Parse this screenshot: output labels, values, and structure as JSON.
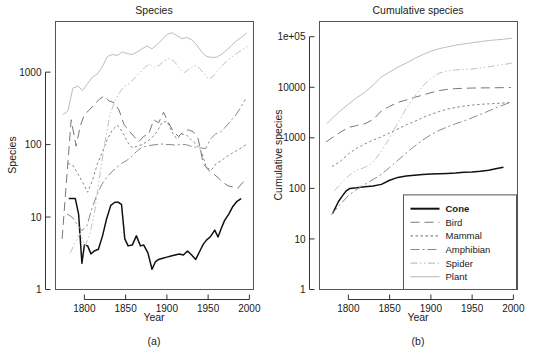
{
  "figure": {
    "width": 535,
    "height": 353,
    "background": "#ffffff"
  },
  "panels": [
    {
      "id": "panel-a",
      "caption": "(a)",
      "title": "Species",
      "xlabel": "Year",
      "ylabel": "Species"
    },
    {
      "id": "panel-b",
      "caption": "(b)",
      "title": "Cumulative species",
      "xlabel": "Year",
      "ylabel": "Cumulative species"
    }
  ],
  "legend": {
    "position": "bottom-right-panel-b",
    "entries": [
      {
        "label": "Cone",
        "color": "#111111",
        "dash": "none",
        "width": 2.0
      },
      {
        "label": "Bird",
        "color": "#777777",
        "dash": "long-dash",
        "width": 1.1
      },
      {
        "label": "Mammal",
        "color": "#888888",
        "dash": "dotted",
        "width": 1.1
      },
      {
        "label": "Amphibian",
        "color": "#8a8a8a",
        "dash": "dash-dot",
        "width": 1.1
      },
      {
        "label": "Spider",
        "color": "#c2c2c2",
        "dash": "dash-dot-dot",
        "width": 1.1
      },
      {
        "label": "Plant",
        "color": "#bdbdbd",
        "dash": "none",
        "width": 1.1
      }
    ]
  },
  "chart_data": [
    {
      "type": "line",
      "panel": "a",
      "title": "Species",
      "xlabel": "Year",
      "ylabel": "Species",
      "xlim": [
        1765,
        2005
      ],
      "ylim": [
        1,
        5000
      ],
      "yscale": "log",
      "xticks": [
        1800,
        1850,
        1900,
        1950,
        2000
      ],
      "xtick_labels": [
        "1800",
        "1850",
        "1900",
        "1950",
        "2000"
      ],
      "yticks": [
        1,
        10,
        100,
        1000
      ],
      "ytick_labels": [
        "1",
        "10",
        "100",
        "1000"
      ],
      "grid": false,
      "legend_position": "none",
      "series": [
        {
          "name": "Cone",
          "color": "#111111",
          "dash": "none",
          "x": [
            1781,
            1789,
            1793,
            1797,
            1800,
            1804,
            1808,
            1812,
            1817,
            1822,
            1827,
            1832,
            1837,
            1841,
            1845,
            1849,
            1853,
            1858,
            1863,
            1868,
            1872,
            1877,
            1882,
            1886,
            1890,
            1895,
            1900,
            1905,
            1910,
            1915,
            1920,
            1925,
            1930,
            1935,
            1940,
            1944,
            1948,
            1953,
            1958,
            1962,
            1966,
            1970,
            1975,
            1980,
            1985,
            1990
          ],
          "y": [
            18,
            18,
            11,
            2.3,
            4.1,
            4.0,
            3.1,
            3.4,
            3.6,
            5.5,
            9.5,
            14.5,
            16,
            16,
            15,
            5.0,
            4.0,
            4.1,
            5.5,
            4.0,
            4.1,
            3.2,
            1.9,
            2.4,
            2.6,
            2.7,
            2.8,
            2.9,
            3.0,
            3.1,
            3.0,
            3.4,
            3.0,
            2.6,
            3.4,
            4.2,
            4.8,
            5.4,
            6.6,
            5.3,
            7.0,
            9.0,
            11.0,
            14.0,
            16.5,
            18.0
          ]
        },
        {
          "name": "Bird",
          "color": "#777777",
          "dash": "long-dash",
          "x": [
            1773,
            1779,
            1784,
            1790,
            1795,
            1800,
            1806,
            1812,
            1818,
            1824,
            1830,
            1836,
            1842,
            1848,
            1854,
            1860,
            1866,
            1872,
            1878,
            1884,
            1890,
            1896,
            1902,
            1908,
            1914,
            1920,
            1926,
            1932,
            1938,
            1944,
            1950,
            1956,
            1962,
            1968,
            1974,
            1980,
            1986,
            1992,
            1997
          ],
          "y": [
            5,
            40,
            220,
            95,
            180,
            260,
            300,
            360,
            420,
            470,
            400,
            380,
            300,
            190,
            155,
            130,
            110,
            130,
            140,
            220,
            200,
            280,
            200,
            150,
            130,
            150,
            160,
            150,
            120,
            55,
            45,
            40,
            35,
            30,
            27,
            26,
            25,
            30,
            35
          ]
        },
        {
          "name": "Mammal",
          "color": "#888888",
          "dash": "dotted",
          "x": [
            1780,
            1786,
            1792,
            1798,
            1804,
            1810,
            1816,
            1822,
            1828,
            1834,
            1840,
            1846,
            1852,
            1858,
            1864,
            1870,
            1876,
            1882,
            1888,
            1894,
            1900,
            1906,
            1912,
            1918,
            1924,
            1930,
            1936,
            1942,
            1948,
            1954,
            1960,
            1966,
            1972,
            1978,
            1984,
            1990,
            1996
          ],
          "y": [
            55,
            52,
            40,
            30,
            22,
            33,
            55,
            80,
            120,
            160,
            185,
            150,
            110,
            90,
            95,
            100,
            110,
            125,
            150,
            200,
            210,
            150,
            120,
            140,
            135,
            115,
            100,
            80,
            48,
            45,
            55,
            60,
            68,
            75,
            82,
            90,
            100
          ]
        },
        {
          "name": "Amphibian",
          "color": "#8a8a8a",
          "dash": "dash-dot",
          "x": [
            1779,
            1785,
            1791,
            1797,
            1803,
            1809,
            1815,
            1821,
            1827,
            1833,
            1839,
            1845,
            1851,
            1857,
            1863,
            1869,
            1875,
            1881,
            1887,
            1893,
            1899,
            1905,
            1911,
            1917,
            1923,
            1929,
            1935,
            1941,
            1947,
            1953,
            1959,
            1965,
            1971,
            1977,
            1983,
            1989,
            1995
          ],
          "y": [
            11,
            10,
            8,
            6.5,
            7.5,
            13,
            20,
            28,
            35,
            42,
            48,
            55,
            60,
            68,
            80,
            90,
            95,
            98,
            100,
            102,
            100,
            100,
            98,
            100,
            100,
            95,
            92,
            90,
            88,
            120,
            140,
            150,
            175,
            210,
            250,
            320,
            420
          ]
        },
        {
          "name": "Spider",
          "color": "#c2c2c2",
          "dash": "dash-dot-dot",
          "x": [
            1783,
            1789,
            1795,
            1801,
            1807,
            1813,
            1819,
            1825,
            1831,
            1837,
            1843,
            1849,
            1855,
            1861,
            1867,
            1873,
            1879,
            1885,
            1891,
            1897,
            1903,
            1909,
            1915,
            1921,
            1927,
            1933,
            1939,
            1945,
            1951,
            1957,
            1963,
            1969,
            1975,
            1981,
            1987,
            1993,
            1998
          ],
          "y": [
            3.2,
            4.5,
            6.0,
            4.0,
            6.0,
            13,
            40,
            110,
            260,
            400,
            530,
            640,
            700,
            830,
            980,
            1150,
            1300,
            1150,
            1250,
            1450,
            1550,
            1400,
            1150,
            980,
            1100,
            1250,
            1150,
            950,
            800,
            900,
            1100,
            1300,
            1500,
            1700,
            1900,
            2100,
            2300
          ]
        },
        {
          "name": "Plant",
          "color": "#bdbdbd",
          "dash": "none",
          "x": [
            1774,
            1780,
            1786,
            1792,
            1798,
            1804,
            1810,
            1816,
            1822,
            1828,
            1834,
            1840,
            1846,
            1852,
            1858,
            1864,
            1870,
            1876,
            1882,
            1888,
            1894,
            1900,
            1906,
            1912,
            1918,
            1924,
            1930,
            1936,
            1942,
            1948,
            1954,
            1960,
            1966,
            1972,
            1978,
            1984,
            1990,
            1997
          ],
          "y": [
            260,
            290,
            600,
            640,
            560,
            700,
            860,
            950,
            1200,
            1650,
            1750,
            1700,
            1900,
            1800,
            1750,
            1900,
            2100,
            2300,
            2100,
            2400,
            2800,
            3300,
            3500,
            3200,
            2900,
            3000,
            2800,
            2400,
            1900,
            1650,
            1600,
            1600,
            1750,
            2000,
            2300,
            2700,
            3000,
            3500
          ]
        }
      ]
    },
    {
      "type": "line",
      "panel": "b",
      "title": "Cumulative species",
      "xlabel": "Year",
      "ylabel": "Cumulative species",
      "xlim": [
        1765,
        2005
      ],
      "ylim": [
        1,
        200000
      ],
      "yscale": "log",
      "xticks": [
        1800,
        1850,
        1900,
        1950,
        2000
      ],
      "xtick_labels": [
        "1800",
        "1850",
        "1900",
        "1950",
        "2000"
      ],
      "yticks": [
        1,
        10,
        100,
        1000,
        10000,
        100000
      ],
      "ytick_labels": [
        "1",
        "10",
        "100",
        "1000",
        "10000",
        "1e+05"
      ],
      "grid": false,
      "legend_position": "lower-right",
      "series": [
        {
          "name": "Cone",
          "color": "#111111",
          "dash": "none",
          "x": [
            1781,
            1788,
            1793,
            1797,
            1802,
            1810,
            1820,
            1830,
            1840,
            1850,
            1860,
            1870,
            1880,
            1890,
            1900,
            1910,
            1920,
            1930,
            1940,
            1950,
            1960,
            1970,
            1980,
            1988
          ],
          "y": [
            32,
            55,
            72,
            88,
            100,
            103,
            108,
            112,
            120,
            145,
            165,
            175,
            182,
            188,
            192,
            195,
            198,
            202,
            208,
            212,
            218,
            228,
            248,
            262
          ]
        },
        {
          "name": "Bird",
          "color": "#777777",
          "dash": "long-dash",
          "x": [
            1773,
            1780,
            1790,
            1800,
            1810,
            1820,
            1830,
            1840,
            1850,
            1860,
            1870,
            1880,
            1890,
            1900,
            1910,
            1920,
            1930,
            1940,
            1950,
            1960,
            1970,
            1980,
            1990,
            1997
          ],
          "y": [
            830,
            1000,
            1280,
            1600,
            1750,
            1900,
            2300,
            3400,
            4200,
            5000,
            5600,
            6300,
            7000,
            7800,
            8600,
            9100,
            9400,
            9550,
            9650,
            9700,
            9750,
            9800,
            9850,
            9900
          ]
        },
        {
          "name": "Mammal",
          "color": "#888888",
          "dash": "dotted",
          "x": [
            1780,
            1790,
            1800,
            1810,
            1820,
            1830,
            1840,
            1850,
            1860,
            1870,
            1880,
            1890,
            1900,
            1910,
            1920,
            1930,
            1940,
            1950,
            1960,
            1970,
            1980,
            1990,
            1996
          ],
          "y": [
            270,
            340,
            480,
            620,
            760,
            900,
            1050,
            1250,
            1500,
            1800,
            2100,
            2500,
            2900,
            3300,
            3700,
            4000,
            4250,
            4450,
            4600,
            4700,
            4800,
            4900,
            5000
          ]
        },
        {
          "name": "Amphibian",
          "color": "#8a8a8a",
          "dash": "dash-dot",
          "x": [
            1779,
            1790,
            1800,
            1810,
            1820,
            1830,
            1840,
            1850,
            1860,
            1870,
            1880,
            1890,
            1900,
            1910,
            1920,
            1930,
            1940,
            1950,
            1960,
            1970,
            1980,
            1990,
            1996
          ],
          "y": [
            30,
            48,
            72,
            95,
            120,
            150,
            190,
            260,
            360,
            500,
            680,
            900,
            1150,
            1400,
            1650,
            1900,
            2150,
            2500,
            2900,
            3400,
            4000,
            4600,
            5000
          ]
        },
        {
          "name": "Spider",
          "color": "#c2c2c2",
          "dash": "dash-dot-dot",
          "x": [
            1783,
            1790,
            1800,
            1810,
            1820,
            1830,
            1840,
            1850,
            1860,
            1870,
            1880,
            1890,
            1900,
            1910,
            1920,
            1930,
            1940,
            1950,
            1960,
            1970,
            1980,
            1990,
            1998
          ],
          "y": [
            90,
            120,
            175,
            230,
            260,
            330,
            550,
            1000,
            2000,
            3800,
            6500,
            10500,
            15000,
            19000,
            21000,
            22000,
            22500,
            23000,
            24000,
            25500,
            27000,
            28500,
            30000
          ]
        },
        {
          "name": "Plant",
          "color": "#bdbdbd",
          "dash": "none",
          "x": [
            1774,
            1780,
            1790,
            1800,
            1810,
            1820,
            1830,
            1840,
            1850,
            1860,
            1870,
            1880,
            1890,
            1900,
            1910,
            1920,
            1930,
            1940,
            1950,
            1960,
            1970,
            1980,
            1990,
            1998
          ],
          "y": [
            1900,
            2400,
            3400,
            4600,
            6200,
            8000,
            11000,
            16000,
            20000,
            25000,
            30000,
            37000,
            44000,
            52000,
            58000,
            63000,
            68000,
            72000,
            76000,
            80000,
            84000,
            87000,
            90000,
            93000
          ]
        }
      ]
    }
  ]
}
